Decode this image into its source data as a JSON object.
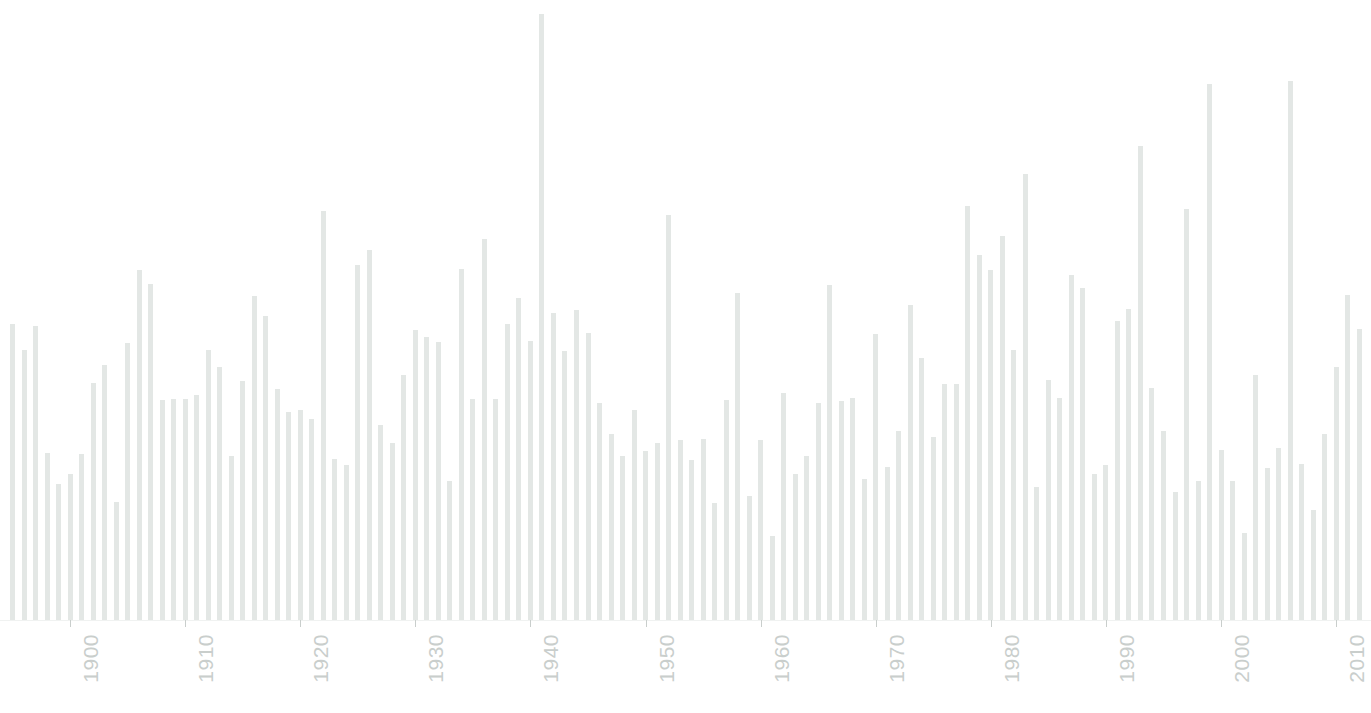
{
  "chart_data": {
    "type": "bar",
    "title": "",
    "subtitle": "",
    "xlabel": "",
    "ylabel": "",
    "grid": false,
    "legend": null,
    "bar_color": "#e3e7e5",
    "axis_color": "#f0f2f1",
    "tick_label_color": "#c9cecc",
    "tick_label_rotation": -90,
    "x_axis_type": "year",
    "xlim": [
      1894.5,
      2012.5
    ],
    "ylim": [
      0,
      100
    ],
    "tick_labels": [
      "1900",
      "1910",
      "1920",
      "1930",
      "1940",
      "1950",
      "1960",
      "1970",
      "1980",
      "1990",
      "2000",
      "2010"
    ],
    "tick_values": [
      1900,
      1910,
      1920,
      1930,
      1940,
      1950,
      1960,
      1970,
      1980,
      1990,
      2000,
      2010
    ],
    "categories": [
      1895,
      1896,
      1897,
      1898,
      1899,
      1900,
      1901,
      1902,
      1903,
      1904,
      1905,
      1906,
      1907,
      1908,
      1909,
      1910,
      1911,
      1912,
      1913,
      1914,
      1915,
      1916,
      1917,
      1918,
      1919,
      1920,
      1921,
      1922,
      1923,
      1924,
      1925,
      1926,
      1927,
      1928,
      1929,
      1930,
      1931,
      1932,
      1933,
      1934,
      1935,
      1936,
      1937,
      1938,
      1939,
      1940,
      1941,
      1942,
      1943,
      1944,
      1945,
      1946,
      1947,
      1948,
      1949,
      1950,
      1951,
      1952,
      1953,
      1954,
      1955,
      1956,
      1957,
      1958,
      1959,
      1960,
      1961,
      1962,
      1963,
      1964,
      1965,
      1966,
      1967,
      1968,
      1969,
      1970,
      1971,
      1972,
      1973,
      1974,
      1975,
      1976,
      1977,
      1978,
      1979,
      1980,
      1981,
      1982,
      1983,
      1984,
      1985,
      1986,
      1987,
      1988,
      1989,
      1990,
      1991,
      1992,
      1993,
      1994,
      1995,
      1996,
      1997,
      1998,
      1999,
      2000,
      2001,
      2002,
      2003,
      2004,
      2005,
      2006,
      2007,
      2008,
      2009,
      2010,
      2011,
      2012
    ],
    "values": [
      47.7,
      43.5,
      47.4,
      27.0,
      22.0,
      23.5,
      26.8,
      38.2,
      41.2,
      19.0,
      44.7,
      56.5,
      54.2,
      35.5,
      35.7,
      35.7,
      36.3,
      43.5,
      40.8,
      26.5,
      38.5,
      52.2,
      49.0,
      37.2,
      33.5,
      33.8,
      32.4,
      66.0,
      26.0,
      25.0,
      57.3,
      59.7,
      31.5,
      28.5,
      39.5,
      46.8,
      45.7,
      44.8,
      22.5,
      56.6,
      35.7,
      61.5,
      35.6,
      47.8,
      52.0,
      45.0,
      97.8,
      49.5,
      43.4,
      50.0,
      46.3,
      35.0,
      30.0,
      26.5,
      33.9,
      27.3,
      28.5,
      65.3,
      29.0,
      25.8,
      29.2,
      18.8,
      35.5,
      52.8,
      20.0,
      29.0,
      13.5,
      36.6,
      23.5,
      26.5,
      35.0,
      54.1,
      35.3,
      35.8,
      22.8,
      46.2,
      24.6,
      30.5,
      50.8,
      42.2,
      29.5,
      38.0,
      38.0,
      66.8,
      58.8,
      56.5,
      62.0,
      43.5,
      72.0,
      21.5,
      38.7,
      35.8,
      55.7,
      53.5,
      23.5,
      25.0,
      48.3,
      50.2,
      76.5,
      37.5,
      30.5,
      20.7,
      66.3,
      22.5,
      86.5,
      27.5,
      22.5,
      14.0,
      39.5,
      24.5,
      27.8,
      87.0,
      25.2,
      17.8,
      30.0,
      40.8,
      52.5,
      47.0
    ]
  }
}
